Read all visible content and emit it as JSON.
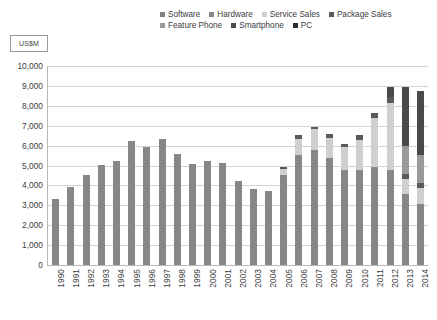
{
  "axis_title": "US$M",
  "legend": {
    "rows": [
      [
        {
          "label": "Software",
          "color": "#808080"
        },
        {
          "label": "Hardware",
          "color": "#878787"
        },
        {
          "label": "Service Sales",
          "color": "#cfcfcf"
        },
        {
          "label": "Package Sales",
          "color": "#5a5a5a"
        }
      ],
      [
        {
          "label": "Feature Phone",
          "color": "#9a9a9a"
        },
        {
          "label": "Smartphone",
          "color": "#4a4a4a"
        },
        {
          "label": "PC",
          "color": "#2b2b2b"
        }
      ]
    ]
  },
  "chart_data": {
    "type": "bar",
    "title": "",
    "subtitle": "",
    "xlabel": "",
    "ylabel": "US$M",
    "ylim": [
      0,
      10000
    ],
    "ytick_labels": [
      "10,000",
      "9,000",
      "8,000",
      "7,000",
      "6,000",
      "5,000",
      "4,000",
      "3,000",
      "2,000",
      "1,000",
      "0"
    ],
    "ytick_values": [
      10000,
      9000,
      8000,
      7000,
      6000,
      5000,
      4000,
      3000,
      2000,
      1000,
      0
    ],
    "grid": true,
    "stacked": true,
    "legend_position": "top",
    "categories": [
      "1990",
      "1991",
      "1992",
      "1993",
      "1994",
      "1995",
      "1996",
      "1997",
      "1998",
      "1999",
      "2000",
      "2001",
      "2002",
      "2003",
      "2004",
      "2005",
      "2006",
      "2007",
      "2008",
      "2009",
      "2010",
      "2011",
      "2012",
      "2013",
      "2014"
    ],
    "series": [
      {
        "name": "Software",
        "color": "#808080",
        "values": [
          0,
          0,
          0,
          0,
          0,
          0,
          0,
          0,
          0,
          0,
          0,
          0,
          0,
          0,
          0,
          0,
          0,
          0,
          0,
          0,
          0,
          0,
          0,
          0,
          0
        ]
      },
      {
        "name": "Hardware",
        "color": "#878787",
        "values": [
          3300,
          3900,
          4500,
          5000,
          5200,
          6200,
          5900,
          6300,
          5550,
          5050,
          5200,
          5100,
          4200,
          3800,
          3700,
          4500,
          5500,
          5750,
          5350,
          4750,
          4750,
          4900,
          4750,
          3550,
          3050
        ]
      },
      {
        "name": "Service Sales",
        "color": "#cfcfcf",
        "values": [
          0,
          0,
          0,
          0,
          0,
          0,
          0,
          0,
          0,
          0,
          0,
          0,
          0,
          0,
          0,
          300,
          800,
          1050,
          1000,
          1150,
          1500,
          2450,
          3350,
          750,
          800
        ]
      },
      {
        "name": "Package Sales",
        "color": "#5a5a5a",
        "values": [
          0,
          0,
          0,
          0,
          0,
          0,
          0,
          0,
          0,
          0,
          0,
          0,
          0,
          0,
          0,
          100,
          200,
          100,
          200,
          150,
          250,
          250,
          300,
          250,
          250
        ]
      },
      {
        "name": "Feature Phone",
        "color": "#9a9a9a",
        "values": [
          0,
          0,
          0,
          0,
          0,
          0,
          0,
          0,
          0,
          0,
          0,
          0,
          0,
          0,
          0,
          0,
          0,
          0,
          0,
          0,
          0,
          0,
          0,
          1400,
          1400
        ]
      },
      {
        "name": "Smartphone",
        "color": "#4a4a4a",
        "values": [
          0,
          0,
          0,
          0,
          0,
          0,
          0,
          0,
          0,
          0,
          0,
          0,
          0,
          0,
          0,
          0,
          0,
          0,
          0,
          0,
          0,
          0,
          500,
          2950,
          3200
        ]
      },
      {
        "name": "PC",
        "color": "#2b2b2b",
        "values": [
          0,
          0,
          0,
          0,
          0,
          0,
          0,
          0,
          0,
          0,
          0,
          0,
          0,
          0,
          0,
          0,
          0,
          0,
          0,
          0,
          0,
          0,
          0,
          0,
          0
        ]
      }
    ],
    "totals": [
      3300,
      3900,
      4500,
      5000,
      5200,
      6200,
      5900,
      6300,
      5550,
      5050,
      5200,
      5100,
      4200,
      3800,
      3700,
      4900,
      6500,
      6900,
      6550,
      6050,
      6500,
      7600,
      8900,
      8900,
      8700
    ]
  }
}
